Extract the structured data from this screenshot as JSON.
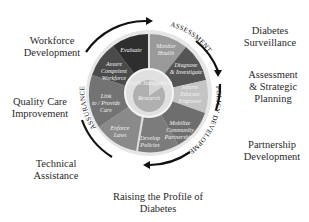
{
  "diagram": {
    "center_label": "System Management",
    "core_label": "Research",
    "phases": [
      {
        "name": "ASSESSMENT"
      },
      {
        "name": "POLICY DEVELOPMENT"
      },
      {
        "name": "ASSURANCE"
      }
    ],
    "segments": [
      {
        "label": "Evaluate",
        "color": "#2e2e2e"
      },
      {
        "label": "Monitor Health",
        "color": "#9a9a9a"
      },
      {
        "label": "Diagnose & Investigate",
        "color": "#555555"
      },
      {
        "label": "Inform Educate Empower",
        "color": "#c4c4c4"
      },
      {
        "label": "Mobilize Community Partnerships",
        "color": "#6e6e6e"
      },
      {
        "label": "Develop Policies",
        "color": "#7c7c7c"
      },
      {
        "label": "Enforce Laws",
        "color": "#8a8a8a"
      },
      {
        "label": "Link to / Provide Care",
        "color": "#737373"
      },
      {
        "label": "Assure Competent Workforce",
        "color": "#4a4a4a"
      }
    ],
    "outer_labels": [
      {
        "text": "Workforce Development"
      },
      {
        "text": "Quality Care Improvement"
      },
      {
        "text": "Technical Assistance"
      },
      {
        "text": "Raising the Profile of Diabetes"
      },
      {
        "text": "Partnership Development"
      },
      {
        "text": "Assessment & Strategic Planning"
      },
      {
        "text": "Diabetes Surveillance"
      }
    ]
  }
}
